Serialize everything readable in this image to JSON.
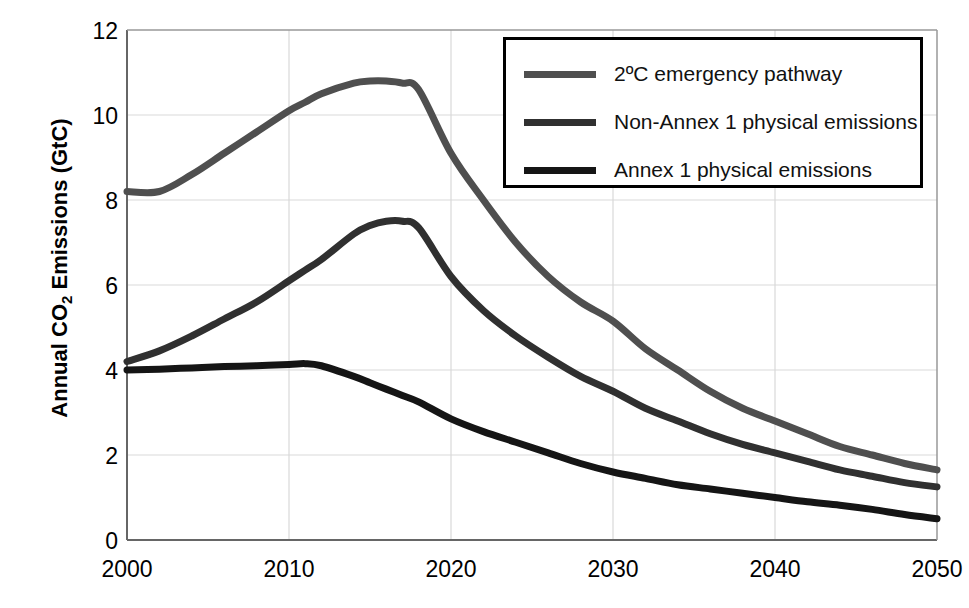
{
  "chart_data": {
    "type": "line",
    "title": "",
    "xlabel": "",
    "ylabel": "Annual CO2 Emissions (GtC)",
    "ylabel_prefix": "Annual CO",
    "ylabel_sub": "2",
    "ylabel_suffix": " Emissions (GtC)",
    "xlim": [
      2000,
      2050
    ],
    "ylim": [
      0,
      12
    ],
    "xticks": [
      "2000",
      "2010",
      "2020",
      "2030",
      "2040",
      "2050"
    ],
    "yticks": [
      "0",
      "2",
      "4",
      "6",
      "8",
      "10",
      "12"
    ],
    "grid": true,
    "legend_position": "top-right",
    "x": [
      2000,
      2002,
      2004,
      2006,
      2008,
      2010,
      2011,
      2012,
      2014,
      2015,
      2016,
      2017,
      2018,
      2020,
      2022,
      2024,
      2026,
      2028,
      2030,
      2032,
      2034,
      2036,
      2038,
      2040,
      2042,
      2044,
      2046,
      2048,
      2050
    ],
    "series": [
      {
        "name": "2ºC emergency pathway",
        "color": "#4f4f4f",
        "values": [
          8.2,
          8.2,
          8.6,
          9.1,
          9.6,
          10.1,
          10.3,
          10.5,
          10.75,
          10.8,
          10.8,
          10.75,
          10.6,
          9.1,
          8.0,
          7.0,
          6.2,
          5.6,
          5.15,
          4.5,
          4.0,
          3.5,
          3.1,
          2.8,
          2.5,
          2.2,
          2.0,
          1.8,
          1.65
        ]
      },
      {
        "name": "Non-Annex 1 physical emissions",
        "color": "#303030",
        "values": [
          4.2,
          4.45,
          4.8,
          5.2,
          5.6,
          6.1,
          6.35,
          6.6,
          7.2,
          7.4,
          7.5,
          7.5,
          7.35,
          6.2,
          5.4,
          4.8,
          4.3,
          3.85,
          3.5,
          3.1,
          2.8,
          2.5,
          2.25,
          2.05,
          1.85,
          1.65,
          1.5,
          1.35,
          1.25
        ]
      },
      {
        "name": "Annex 1 physical emissions",
        "color": "#151515",
        "values": [
          4.0,
          4.02,
          4.05,
          4.08,
          4.1,
          4.13,
          4.15,
          4.1,
          3.85,
          3.7,
          3.55,
          3.4,
          3.25,
          2.85,
          2.55,
          2.3,
          2.05,
          1.8,
          1.6,
          1.45,
          1.3,
          1.2,
          1.1,
          1.0,
          0.9,
          0.82,
          0.72,
          0.6,
          0.5
        ]
      }
    ],
    "key_points": {
      "pathway_peak_year": 2015,
      "pathway_peak_value": 10.8,
      "non_annex_peak_year": 2017,
      "non_annex_peak_value": 7.5,
      "annex_peak_year": 2011,
      "annex_peak_value": 4.15,
      "pathway_end_2050": 1.65,
      "non_annex_end_2050": 1.25,
      "annex_end_2050": 0.5
    }
  },
  "legend": {
    "items": [
      {
        "label": "2ºC emergency pathway",
        "color": "#4f4f4f"
      },
      {
        "label": "Non-Annex 1 physical emissions",
        "color": "#303030"
      },
      {
        "label": "Annex 1 physical emissions",
        "color": "#151515"
      }
    ]
  },
  "colors": {
    "axis": "#555555",
    "grid": "#d9d9d9",
    "text": "#000000",
    "background": "#ffffff"
  }
}
